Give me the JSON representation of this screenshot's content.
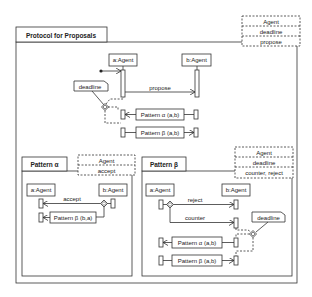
{
  "main": {
    "title": "Protocol for Proposals",
    "template": [
      "Agent",
      "deadline",
      "propose"
    ],
    "lifelines": [
      "a:Agent",
      "b:Agent"
    ],
    "messages": {
      "propose": "propose"
    },
    "note": "deadline",
    "refs": [
      "Pattern α (a,b)",
      "Pattern β (a,b)"
    ]
  },
  "alpha": {
    "title": "Pattern α",
    "template": [
      "Agent",
      "accept"
    ],
    "lifelines": [
      "a:Agent",
      "b:Agent"
    ],
    "messages": {
      "accept": "accept"
    },
    "refs": [
      "Pattern β (b,a)"
    ]
  },
  "beta": {
    "title": "Pattern β",
    "template": [
      "Agent",
      "deadline",
      "counter, reject"
    ],
    "lifelines": [
      "a:Agent",
      "b:Agent"
    ],
    "messages": {
      "reject": "reject",
      "counter": "counter"
    },
    "note": "deadline",
    "refs": [
      "Pattern α (a,b)",
      "Pattern β (a,b)"
    ]
  }
}
